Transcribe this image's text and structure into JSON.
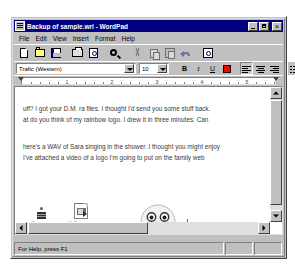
{
  "window": {
    "title": "Backup of sample.wri - WordPad",
    "icon": "wordpad-document-icon",
    "minimize_label": "Minimize",
    "maximize_label": "Maximize",
    "close_label": "Close"
  },
  "menu": {
    "items": [
      {
        "label": "File"
      },
      {
        "label": "Edit"
      },
      {
        "label": "View"
      },
      {
        "label": "Insert"
      },
      {
        "label": "Format"
      },
      {
        "label": "Help"
      }
    ]
  },
  "toolbar": {
    "buttons": [
      {
        "name": "new-button",
        "tooltip": "New",
        "icon": "new-document-icon",
        "enabled": true
      },
      {
        "name": "open-button",
        "tooltip": "Open",
        "icon": "open-folder-icon",
        "enabled": true
      },
      {
        "name": "save-button",
        "tooltip": "Save",
        "icon": "floppy-disk-icon",
        "enabled": true
      },
      {
        "name": "print-button",
        "tooltip": "Print",
        "icon": "printer-icon",
        "enabled": true
      },
      {
        "name": "print-preview-button",
        "tooltip": "Print Preview",
        "icon": "print-preview-icon",
        "enabled": true
      },
      {
        "name": "find-button",
        "tooltip": "Find",
        "icon": "binoculars-icon",
        "enabled": true
      },
      {
        "name": "cut-button",
        "tooltip": "Cut",
        "icon": "scissors-icon",
        "enabled": false
      },
      {
        "name": "copy-button",
        "tooltip": "Copy",
        "icon": "copy-pages-icon",
        "enabled": false
      },
      {
        "name": "paste-button",
        "tooltip": "Paste",
        "icon": "clipboard-icon",
        "enabled": false
      },
      {
        "name": "undo-button",
        "tooltip": "Undo",
        "icon": "undo-arrow-icon",
        "enabled": false
      },
      {
        "name": "date-time-button",
        "tooltip": "Date/Time",
        "icon": "date-time-icon",
        "enabled": true
      }
    ]
  },
  "formatbar": {
    "font_name": "Trafic (Western)",
    "font_size": "10",
    "buttons": [
      {
        "name": "bold-button",
        "label": "B",
        "style": "b",
        "pressed": false
      },
      {
        "name": "italic-button",
        "label": "I",
        "style": "i",
        "pressed": false
      },
      {
        "name": "underline-button",
        "label": "U",
        "style": "u",
        "pressed": false
      },
      {
        "name": "color-button",
        "label": "",
        "style": "color",
        "pressed": false
      },
      {
        "name": "align-left-button",
        "label": "",
        "style": "align-left",
        "pressed": true
      },
      {
        "name": "align-center-button",
        "label": "",
        "style": "align-center",
        "pressed": false
      },
      {
        "name": "align-right-button",
        "label": "",
        "style": "align-right",
        "pressed": false
      },
      {
        "name": "bullets-button",
        "label": "",
        "style": "bullets",
        "pressed": false
      }
    ]
  },
  "ruler": {
    "numbers": [
      "1",
      "2",
      "3",
      "4",
      "5"
    ]
  },
  "document": {
    "paragraph1": [
      "uff?  I got your D.M. ra files.   I thought I'd send you some stuff back.",
      "at do you think of my rainbow logo.   I drew it in three minutes.   Can"
    ],
    "paragraph2": [
      "here's a WAV of Sara singing in the shower.   I thought you might enjoy",
      "I've attached a video of a logo I'm going to put on the family web"
    ],
    "objects": [
      {
        "name": "embedded-sound-object",
        "icon": "sound-wave-icon",
        "label": "Sara note"
      },
      {
        "name": "embedded-avi-object",
        "icon": "avi-file-icon",
        "label": "Halfbaque.avi"
      },
      {
        "name": "embedded-bitmap-object",
        "icon": "smiley-face-bitmap",
        "label": ""
      }
    ]
  },
  "scrollbars": {
    "vertical_up": "Scroll up",
    "vertical_down": "Scroll down",
    "horizontal_left": "Scroll left",
    "horizontal_right": "Scroll right"
  },
  "statusbar": {
    "message": "For Help, press F1",
    "pane2": "",
    "pane3": ""
  },
  "colors": {
    "titlebar": "#000080",
    "face": "#c0c0c0",
    "page": "#ffffff",
    "text": "#3a3a3a"
  }
}
